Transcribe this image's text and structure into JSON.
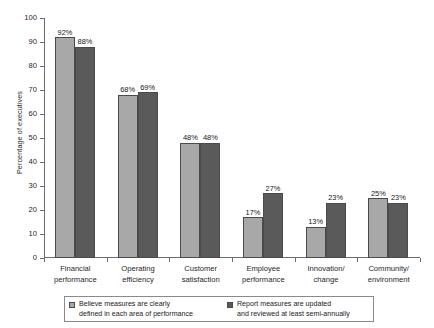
{
  "chart_data": {
    "type": "bar",
    "title": "",
    "xlabel": "",
    "ylabel": "Percentage of executives",
    "ylim": [
      0,
      100
    ],
    "ytick_step": 10,
    "ytick_labels": [
      "0",
      "10",
      "20",
      "30",
      "40",
      "50",
      "60",
      "70",
      "80",
      "90",
      "100"
    ],
    "grid": false,
    "legend_position": "bottom",
    "categories": [
      "Financial\nperformance",
      "Operating\nefficiency",
      "Customer\nsatisfaction",
      "Employee\nperformance",
      "Innovation/\nchange",
      "Community/\nenvironment"
    ],
    "series": [
      {
        "name": "Believe measures are clearly\ndefined in each area of performance",
        "color": "#a8a8a8",
        "values": [
          92,
          68,
          48,
          17,
          13,
          25
        ],
        "value_labels": [
          "92%",
          "68%",
          "48%",
          "17%",
          "13%",
          "25%"
        ]
      },
      {
        "name": "Report measures are updated\nand reviewed at least semi-annually",
        "color": "#5a5a5a",
        "values": [
          88,
          69,
          48,
          27,
          23,
          23
        ],
        "value_labels": [
          "88%",
          "69%",
          "48%",
          "27%",
          "23%",
          "23%"
        ]
      }
    ],
    "colors": {
      "series1": "#a8a8a8",
      "series2": "#5a5a5a",
      "axis": "#6d6d6d",
      "bar_outline": "#4a4a4a",
      "text": "#1a1a1a",
      "background": "#ffffff"
    }
  }
}
